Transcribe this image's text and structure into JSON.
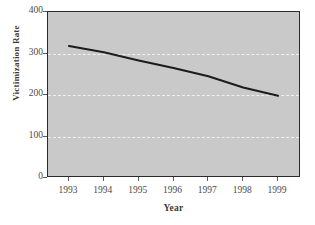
{
  "figure": {
    "background_color": "#ffffff",
    "plot_background_color": "#c9c9c9",
    "frame_color": "#2b2b2b",
    "gridline_color": "#efefef",
    "line_color": "#1c1c1c"
  },
  "chart_data": {
    "type": "line",
    "title": "",
    "xlabel": "Year",
    "ylabel": "Victimization Rate",
    "categories": [
      "1993",
      "1994",
      "1995",
      "1996",
      "1997",
      "1998",
      "1999"
    ],
    "x": [
      1993,
      1994,
      1995,
      1996,
      1997,
      1998,
      1999
    ],
    "values": [
      318,
      303,
      283,
      265,
      245,
      218,
      198
    ],
    "series": [
      {
        "name": "Victimization Rate",
        "values": [
          318,
          303,
          283,
          265,
          245,
          218,
          198
        ]
      }
    ],
    "xlim": [
      1993,
      1999
    ],
    "ylim": [
      0,
      400
    ],
    "ytick_labels": [
      "0",
      "100",
      "200",
      "300",
      "400"
    ],
    "ytick_values": [
      0,
      100,
      200,
      300,
      400
    ],
    "xtick_labels": [
      "1993",
      "1994",
      "1995",
      "1996",
      "1997",
      "1998",
      "1999"
    ],
    "grid": true,
    "gridlines_at": [
      100,
      200,
      300
    ],
    "legend": false,
    "legend_position": "none"
  }
}
